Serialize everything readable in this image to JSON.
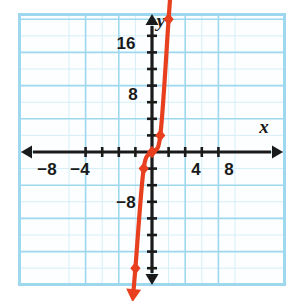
{
  "figure": {
    "kind": "coordinate-graph",
    "background_color": "#ffffff",
    "plot_area": {
      "border_color": "#9ed8ef",
      "grid_minor_color": "#d6eef8",
      "grid_major_color": "#9ed8ef",
      "x_px": 19,
      "y_px": 14,
      "w_px": 266,
      "h_px": 271
    },
    "axis_color": "#1a1a1a",
    "curve_color": "#e8401f"
  },
  "axes": {
    "x_name": "x",
    "y_name": "y",
    "x_name_pos": {
      "x": 264,
      "y": 133
    },
    "y_name_pos": {
      "x": 161,
      "y": 27
    },
    "origin_px": {
      "x": 152,
      "y": 152
    },
    "px_per_unit": 8.3,
    "xlim": [
      -10,
      10
    ],
    "ylim": [
      -16.5,
      16.5
    ],
    "tick_step": 2,
    "grid_step": 4,
    "x_tick_labels": [
      {
        "value": -8,
        "text": "−8",
        "x": 47,
        "y": 175
      },
      {
        "value": -4,
        "text": "−4",
        "x": 80,
        "y": 175
      },
      {
        "value": 4,
        "text": "4",
        "x": 196,
        "y": 175
      },
      {
        "value": 8,
        "text": "8",
        "x": 229,
        "y": 175
      }
    ],
    "y_tick_labels": [
      {
        "value": 16,
        "text": "16",
        "x": 126,
        "y": 49
      },
      {
        "value": 8,
        "text": "8",
        "x": 133,
        "y": 100
      },
      {
        "value": -8,
        "text": "−8",
        "x": 126,
        "y": 208
      }
    ]
  },
  "chart_data": {
    "type": "line",
    "title": "",
    "xlabel": "x",
    "ylabel": "y",
    "xlim": [
      -10,
      10
    ],
    "ylim": [
      -16.5,
      16.5
    ],
    "grid": true,
    "legend": "none",
    "series": [
      {
        "name": "cubic-curve",
        "color": "#e8401f",
        "marker": "diamond",
        "arrow_start": true,
        "arrow_end": true,
        "x": [
          -2,
          -1,
          0,
          1,
          2
        ],
        "y": [
          -14,
          -2,
          0,
          2,
          16
        ],
        "points": [
          {
            "x": -2,
            "y": -14
          },
          {
            "x": -1,
            "y": -2
          },
          {
            "x": 0,
            "y": 0
          },
          {
            "x": 1,
            "y": 2
          },
          {
            "x": 2,
            "y": 16
          }
        ]
      }
    ],
    "annotations": []
  }
}
